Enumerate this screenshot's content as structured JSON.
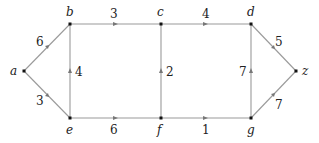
{
  "diagram": {
    "type": "weighted-graph",
    "nodes": [
      {
        "id": "a",
        "label": "a",
        "x": 24,
        "y": 71
      },
      {
        "id": "b",
        "label": "b",
        "x": 70,
        "y": 24
      },
      {
        "id": "c",
        "label": "c",
        "x": 161,
        "y": 24
      },
      {
        "id": "d",
        "label": "d",
        "x": 251,
        "y": 24
      },
      {
        "id": "e",
        "label": "e",
        "x": 70,
        "y": 118
      },
      {
        "id": "f",
        "label": "f",
        "x": 161,
        "y": 118
      },
      {
        "id": "g",
        "label": "g",
        "x": 251,
        "y": 118
      },
      {
        "id": "z",
        "label": "z",
        "x": 296,
        "y": 71
      }
    ],
    "edges": [
      {
        "from": "a",
        "to": "b",
        "weight": "6"
      },
      {
        "from": "a",
        "to": "e",
        "weight": "3"
      },
      {
        "from": "b",
        "to": "c",
        "weight": "3"
      },
      {
        "from": "e",
        "to": "b",
        "weight": "4"
      },
      {
        "from": "c",
        "to": "d",
        "weight": "4"
      },
      {
        "from": "f",
        "to": "c",
        "weight": "2"
      },
      {
        "from": "e",
        "to": "f",
        "weight": "6"
      },
      {
        "from": "f",
        "to": "g",
        "weight": "1"
      },
      {
        "from": "g",
        "to": "d",
        "weight": "7"
      },
      {
        "from": "d",
        "to": "z",
        "weight": "5"
      },
      {
        "from": "g",
        "to": "z",
        "weight": "7"
      }
    ]
  }
}
